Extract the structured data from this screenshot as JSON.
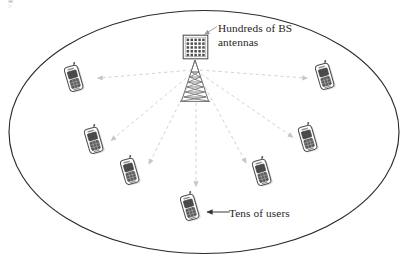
{
  "figure": {
    "kind": "massive-mimo-cell-diagram",
    "canvas": {
      "width": 408,
      "height": 272
    },
    "background_color": "#ffffff",
    "cell_boundary": {
      "name": "cell-coverage-ellipse",
      "shape": "ellipse",
      "center": [
        204,
        132
      ],
      "radius_x": 196,
      "radius_y": 122,
      "stroke": "#2b2b2b",
      "stroke_width": 1.1,
      "fill": "none"
    },
    "base_station": {
      "name": "base-station",
      "antenna_panel": {
        "x": 183,
        "y": 35,
        "width": 25,
        "height": 24,
        "grid_rows": 5,
        "grid_cols": 5,
        "stroke": "#4a4a4a",
        "dot_color": "#555555"
      },
      "tower": {
        "apex": [
          195,
          60
        ],
        "base_left": [
          181,
          101
        ],
        "base_right": [
          209,
          101
        ],
        "stroke": "#6b6b6b",
        "lattice_levels": 7
      }
    },
    "labels": {
      "bs_antennas": {
        "line1": "Hundreds of BS",
        "line2": "antennas"
      },
      "users": "Tens of users",
      "users_arrow_glyph": "←"
    },
    "colors": {
      "ink": "#262626",
      "ellipse": "#2b2b2b",
      "beam_dashed": "#cfcfcf",
      "arrowhead": "#c2c2c2",
      "callout_arrow": "#9a9a9a",
      "phone_body_fill": "#ffffff",
      "phone_body_stroke": "#4e4e4e",
      "phone_screen": "#4a4a4a",
      "phone_shadow": "#d9d9d9"
    },
    "beams": {
      "name": "downlink-beams",
      "origin": [
        195,
        72
      ],
      "style": "dashed",
      "dash_pattern": "3,3",
      "stroke": "#cfcfcf",
      "stroke_width": 0.9,
      "arrowhead_size": 4.5,
      "targets": [
        {
          "id": "beam-to-user-1",
          "to": [
            96,
            78
          ],
          "arrow_at": [
            98,
            78
          ],
          "angle": 182
        },
        {
          "id": "beam-to-user-2",
          "to": [
            108,
            140
          ],
          "arrow_at": [
            110,
            139
          ],
          "angle": 208
        },
        {
          "id": "beam-to-user-3",
          "to": [
            146,
            163
          ],
          "arrow_at": [
            148,
            162
          ],
          "angle": 222
        },
        {
          "id": "beam-to-user-4",
          "to": [
            196,
            185
          ],
          "arrow_at": [
            196,
            186
          ],
          "angle": 270
        },
        {
          "id": "beam-to-user-5",
          "to": [
            248,
            162
          ],
          "arrow_at": [
            247,
            161
          ],
          "angle": 318
        },
        {
          "id": "beam-to-user-6",
          "to": [
            295,
            137
          ],
          "arrow_at": [
            294,
            136
          ],
          "angle": 332
        },
        {
          "id": "beam-to-user-7",
          "to": [
            309,
            78
          ],
          "arrow_at": [
            308,
            78
          ],
          "angle": 358
        }
      ]
    },
    "users": [
      {
        "id": "user-handset-1",
        "label": "mobile-user",
        "x": 62,
        "y": 66,
        "rotate": -16,
        "scale": 1.0
      },
      {
        "id": "user-handset-2",
        "label": "mobile-user",
        "x": 82,
        "y": 128,
        "rotate": -16,
        "scale": 1.0
      },
      {
        "id": "user-handset-3",
        "label": "mobile-user",
        "x": 118,
        "y": 159,
        "rotate": -16,
        "scale": 1.0
      },
      {
        "id": "user-handset-4",
        "label": "mobile-user",
        "x": 178,
        "y": 195,
        "rotate": -16,
        "scale": 1.0
      },
      {
        "id": "user-handset-5",
        "label": "mobile-user",
        "x": 250,
        "y": 160,
        "rotate": -16,
        "scale": 1.0
      },
      {
        "id": "user-handset-6",
        "label": "mobile-user",
        "x": 296,
        "y": 126,
        "rotate": -16,
        "scale": 1.0
      },
      {
        "id": "user-handset-7",
        "label": "mobile-user",
        "x": 313,
        "y": 64,
        "rotate": -16,
        "scale": 1.0
      }
    ],
    "callout_arrows": [
      {
        "id": "bs-callout-arrow",
        "from": [
          216,
          27
        ],
        "to": [
          203,
          35
        ],
        "stroke": "#9a9a9a",
        "head": "triangle"
      },
      {
        "id": "users-callout-arrow",
        "from": [
          228,
          212
        ],
        "to": [
          208,
          212
        ],
        "stroke": "#3a3a3a",
        "head": "triangle"
      }
    ]
  }
}
